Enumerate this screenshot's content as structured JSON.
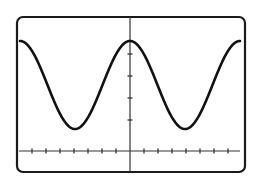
{
  "diagram": {
    "type": "oscilloscope-trace",
    "colors": {
      "background": "#ffffff",
      "frame": "#1a1a1a",
      "axes": "#333333",
      "trace": "#111111"
    }
  },
  "chart_data": {
    "type": "line",
    "title": "",
    "xlabel": "",
    "ylabel": "",
    "grid": false,
    "legend": "none",
    "waveform": "cosine",
    "frame": {
      "x": 17,
      "y": 17,
      "width": 228,
      "height": 155,
      "corner_radius": 6
    },
    "axes": {
      "vertical_axis_x": 130,
      "horizontal_axis_y": 151,
      "horizontal_axis_x_start": 19,
      "horizontal_axis_x_end": 240,
      "horizontal_tick_spacing_px": 14,
      "vertical_tick_positions_y": [
        41,
        54,
        76,
        98,
        120
      ]
    },
    "trace": {
      "x_start": 20,
      "x_end": 240,
      "center_y": 85,
      "amplitude_px": 44,
      "period_px": 110,
      "peak_x": 130,
      "peaks_y": 41,
      "troughs_x": [
        75,
        185
      ],
      "troughs_y": 129
    },
    "series": [
      {
        "name": "trace",
        "points": "y = 85 - 44*cos(2*pi*(x-130)/110), x in [20,240]"
      }
    ]
  }
}
